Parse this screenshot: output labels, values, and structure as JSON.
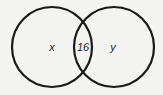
{
  "diagram": {
    "type": "venn",
    "regions": {
      "left_only": "x",
      "intersection": "16",
      "right_only": "y"
    },
    "colors": {
      "background": "#f4f4f2",
      "stroke": "#1a1a1a",
      "text": "#222222"
    }
  }
}
